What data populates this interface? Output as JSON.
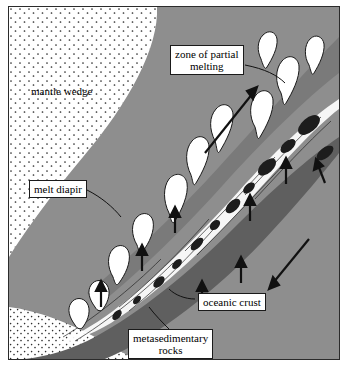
{
  "figure": {
    "title": "",
    "labels": [
      {
        "id": "mantle-wedge",
        "text": "mantle wedge",
        "boxed": false,
        "x": 22,
        "y": 78
      },
      {
        "id": "zone-of-partial-melting",
        "text": "zone of partial\nmelting",
        "boxed": true,
        "x": 161,
        "y": 38
      },
      {
        "id": "melt-diapir",
        "text": "melt diapir",
        "boxed": true,
        "x": 20,
        "y": 173
      },
      {
        "id": "oceanic-crust",
        "text": "oceanic crust",
        "boxed": true,
        "x": 189,
        "y": 286
      },
      {
        "id": "metasedimentary-rocks",
        "text": "metasedimentary\nrocks",
        "boxed": true,
        "x": 119,
        "y": 322
      }
    ],
    "colors": {
      "background": "#ffffff",
      "frame": "#2b2b2b",
      "mantle_stipple_fill": "#ffffff",
      "slab_gray": "#8e8e8e",
      "crust_dark": "#5f5f5f",
      "melt_fill": "#ffffff",
      "ink": "#111111"
    },
    "arrows": [
      {
        "id": "arrow-melt-ascent-main",
        "direction": "up-right",
        "x1": 206,
        "y1": 140,
        "x2": 250,
        "y2": 82
      },
      {
        "id": "arrow-slab-descent",
        "direction": "down-right",
        "x1": 296,
        "y1": 235,
        "x2": 261,
        "y2": 277
      },
      {
        "id": "arrow-up-1",
        "direction": "up",
        "x1": 92,
        "y1": 298,
        "x2": 92,
        "y2": 276
      },
      {
        "id": "arrow-up-2",
        "direction": "up",
        "x1": 133,
        "y1": 262,
        "x2": 133,
        "y2": 238
      },
      {
        "id": "arrow-up-3",
        "direction": "up",
        "x1": 166,
        "y1": 225,
        "x2": 166,
        "y2": 200
      },
      {
        "id": "arrow-up-4",
        "direction": "up",
        "x1": 193,
        "y1": 298,
        "x2": 193,
        "y2": 276
      },
      {
        "id": "arrow-up-5",
        "direction": "up",
        "x1": 232,
        "y1": 274,
        "x2": 232,
        "y2": 250
      },
      {
        "id": "arrow-up-6",
        "direction": "up",
        "x1": 241,
        "y1": 212,
        "x2": 241,
        "y2": 190
      },
      {
        "id": "arrow-up-7",
        "direction": "up",
        "x1": 277,
        "y1": 175,
        "x2": 277,
        "y2": 152
      },
      {
        "id": "arrow-up-right-edge",
        "direction": "up-left",
        "x1": 315,
        "y1": 175,
        "x2": 307,
        "y2": 155
      }
    ]
  }
}
